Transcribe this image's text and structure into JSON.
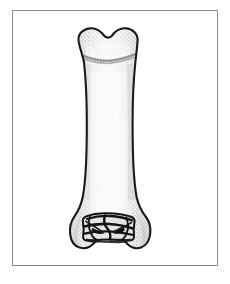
{
  "figure": {
    "view_label": "anterior view",
    "background_color": "#ffffff",
    "frame": {
      "border_color": "#8a8a8a",
      "fill_color": "#ffffff",
      "x": 12,
      "y": 10,
      "width": 206,
      "height": 256
    },
    "specimen": {
      "name": "long-bone",
      "outline_color": "#1a1a1a",
      "fill_light": "#fbfbfb",
      "fill_mid": "#ededed",
      "fill_shadow": "#d8d8d8",
      "stipple_color": "#9a9a9a",
      "articular_dark": "#141414",
      "proximal_end": {
        "label": "proximal-end",
        "description": "bilobed head with central notch",
        "notch_center_x": 108,
        "left_x": 78,
        "right_x": 138,
        "top_y": 28
      },
      "growth_line": {
        "label": "epiphyseal-line",
        "y": 55
      },
      "shaft": {
        "label": "diaphysis",
        "narrowest_left_x": 82,
        "narrowest_right_x": 132,
        "narrowest_y": 150
      },
      "distal_end": {
        "label": "distal-condyles",
        "left_x": 70,
        "right_x": 150,
        "bottom_y": 248
      }
    }
  }
}
